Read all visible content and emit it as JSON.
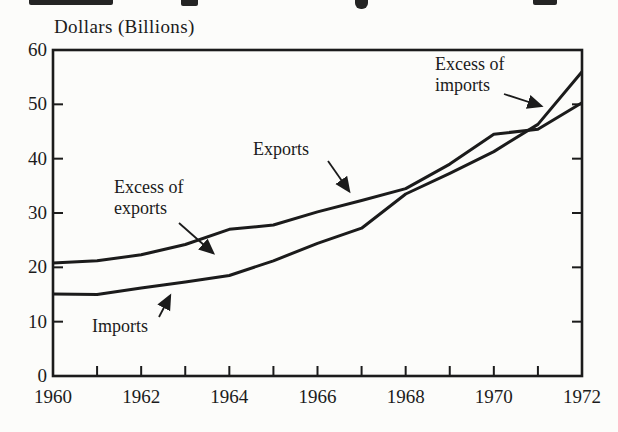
{
  "figure": {
    "background": "#fcfcfa",
    "ink_color": "#1b1b1b"
  },
  "chart_data": {
    "type": "line",
    "title": "",
    "ylabel": "Dollars (Billions)",
    "xlabel": "",
    "x": [
      1960,
      1961,
      1962,
      1963,
      1964,
      1965,
      1966,
      1967,
      1968,
      1969,
      1970,
      1971,
      1972
    ],
    "series": [
      {
        "name": "Exports",
        "values": [
          20.8,
          21.2,
          22.3,
          24.2,
          27.0,
          27.8,
          30.2,
          32.3,
          34.5,
          39.0,
          44.5,
          45.4,
          50.3
        ]
      },
      {
        "name": "Imports",
        "values": [
          15.1,
          15.0,
          16.2,
          17.3,
          18.5,
          21.2,
          24.4,
          27.2,
          33.5,
          37.3,
          41.3,
          46.3,
          56.0
        ]
      }
    ],
    "xlim": [
      1960,
      1972
    ],
    "ylim": [
      0,
      60
    ],
    "y_ticks": [
      0,
      10,
      20,
      30,
      40,
      50,
      60
    ],
    "y_tick_labels": [
      "0",
      "10",
      "20",
      "30",
      "40",
      "50",
      "60"
    ],
    "x_ticks": [
      1960,
      1962,
      1964,
      1966,
      1968,
      1970,
      1972
    ],
    "x_tick_labels": [
      "1960",
      "1962",
      "1964",
      "1966",
      "1968",
      "1970",
      "1972"
    ],
    "grid": false,
    "legend_position": "none (inline arrowed annotations)"
  },
  "annotations": {
    "exports": {
      "label": "Exports"
    },
    "imports": {
      "label": "Imports"
    },
    "excess_exports": {
      "line1": "Excess of",
      "line2": "exports"
    },
    "excess_imports": {
      "line1": "Excess of",
      "line2": "imports"
    }
  }
}
